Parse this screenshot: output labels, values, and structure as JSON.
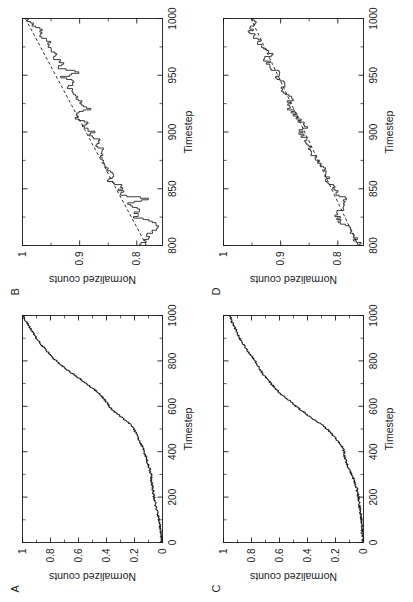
{
  "figure": {
    "layout": "2x2 panel grid, rotated 90 degrees counter-clockwise on the page",
    "background_color": "#ffffff",
    "line_color": "#1a1a1a",
    "panels": [
      "A",
      "B",
      "C",
      "D"
    ]
  },
  "panels": {
    "A": {
      "label": "A"
    },
    "B": {
      "label": "B"
    },
    "C": {
      "label": "C"
    },
    "D": {
      "label": "D"
    }
  },
  "chart_data": [
    {
      "panel": "A",
      "type": "line",
      "title": "",
      "xlabel": "Timestep",
      "ylabel": "Normalized counts",
      "xlim": [
        0,
        1000
      ],
      "ylim": [
        0,
        1
      ],
      "xticks": [
        "0",
        "200",
        "400",
        "600",
        "800",
        "1000"
      ],
      "xtick_values": [
        0,
        200,
        400,
        600,
        800,
        1000
      ],
      "yticks": [
        "0",
        "0.2",
        "0.4",
        "0.6",
        "0.8",
        "1"
      ],
      "ytick_values": [
        0,
        0.2,
        0.4,
        0.6,
        0.8,
        1
      ],
      "grid": false,
      "legend": "none",
      "series": [
        {
          "name": "normalized counts",
          "style": "solid",
          "x": [
            0,
            20,
            40,
            60,
            80,
            100,
            120,
            140,
            160,
            180,
            200,
            220,
            240,
            260,
            280,
            300,
            320,
            340,
            360,
            380,
            400,
            420,
            440,
            460,
            480,
            500,
            520,
            540,
            560,
            580,
            600,
            620,
            640,
            660,
            680,
            700,
            720,
            740,
            760,
            780,
            800,
            820,
            840,
            860,
            880,
            900,
            920,
            940,
            960,
            980,
            1000
          ],
          "values": [
            0.005,
            0.008,
            0.012,
            0.015,
            0.02,
            0.025,
            0.032,
            0.04,
            0.048,
            0.055,
            0.06,
            0.065,
            0.07,
            0.075,
            0.08,
            0.082,
            0.09,
            0.1,
            0.11,
            0.12,
            0.13,
            0.145,
            0.16,
            0.175,
            0.19,
            0.205,
            0.23,
            0.27,
            0.31,
            0.35,
            0.38,
            0.4,
            0.43,
            0.46,
            0.5,
            0.545,
            0.59,
            0.635,
            0.68,
            0.72,
            0.76,
            0.79,
            0.82,
            0.85,
            0.875,
            0.9,
            0.92,
            0.94,
            0.96,
            0.98,
            0.995
          ]
        }
      ]
    },
    {
      "panel": "B",
      "type": "line",
      "title": "",
      "xlabel": "Timestep",
      "ylabel": "Normalized counts",
      "xlim": [
        800,
        1000
      ],
      "ylim": [
        0.755,
        1.0
      ],
      "xticks": [
        "800",
        "850",
        "900",
        "950",
        "1000"
      ],
      "xtick_values": [
        800,
        850,
        900,
        950,
        1000
      ],
      "yticks": [
        "0.8",
        "0.9",
        "1"
      ],
      "ytick_values": [
        0.8,
        0.9,
        1
      ],
      "grid": false,
      "legend": "none",
      "series": [
        {
          "name": "normalized counts",
          "style": "solid-step",
          "x": [
            800,
            804,
            808,
            812,
            816,
            820,
            824,
            828,
            832,
            836,
            840,
            844,
            848,
            852,
            856,
            860,
            864,
            868,
            872,
            876,
            880,
            884,
            888,
            892,
            896,
            900,
            904,
            908,
            912,
            916,
            920,
            924,
            928,
            932,
            936,
            940,
            944,
            948,
            952,
            956,
            960,
            964,
            968,
            972,
            976,
            980,
            984,
            988,
            992,
            996,
            1000
          ],
          "values": [
            0.793,
            0.784,
            0.782,
            0.772,
            0.765,
            0.768,
            0.802,
            0.803,
            0.795,
            0.818,
            0.778,
            0.826,
            0.828,
            0.824,
            0.848,
            0.842,
            0.846,
            0.855,
            0.852,
            0.864,
            0.858,
            0.862,
            0.872,
            0.866,
            0.88,
            0.878,
            0.894,
            0.886,
            0.906,
            0.902,
            0.882,
            0.898,
            0.904,
            0.912,
            0.918,
            0.916,
            0.908,
            0.93,
            0.902,
            0.936,
            0.93,
            0.942,
            0.945,
            0.952,
            0.948,
            0.958,
            0.972,
            0.966,
            0.978,
            0.985,
            0.995
          ]
        },
        {
          "name": "linear fit",
          "style": "dashed",
          "x": [
            800,
            1000
          ],
          "values": [
            0.783,
            0.995
          ]
        }
      ]
    },
    {
      "panel": "C",
      "type": "line",
      "title": "",
      "xlabel": "Timestep",
      "ylabel": "Normalized counts",
      "xlim": [
        0,
        1000
      ],
      "ylim": [
        0,
        1
      ],
      "xticks": [
        "0",
        "200",
        "400",
        "600",
        "800",
        "1000"
      ],
      "xtick_values": [
        0,
        200,
        400,
        600,
        800,
        1000
      ],
      "yticks": [
        "0",
        "0.2",
        "0.4",
        "0.6",
        "0.8",
        "1"
      ],
      "ytick_values": [
        0,
        0.2,
        0.4,
        0.6,
        0.8,
        1
      ],
      "grid": false,
      "legend": "none",
      "series": [
        {
          "name": "normalized counts",
          "style": "solid",
          "x": [
            0,
            20,
            40,
            60,
            80,
            100,
            120,
            140,
            160,
            180,
            200,
            220,
            240,
            260,
            280,
            300,
            320,
            340,
            360,
            380,
            400,
            420,
            440,
            460,
            480,
            500,
            520,
            540,
            560,
            580,
            600,
            620,
            640,
            660,
            680,
            700,
            720,
            740,
            760,
            780,
            800,
            820,
            840,
            860,
            880,
            900,
            920,
            940,
            960,
            980,
            1000
          ],
          "values": [
            0.004,
            0.006,
            0.008,
            0.01,
            0.013,
            0.016,
            0.02,
            0.024,
            0.028,
            0.032,
            0.036,
            0.042,
            0.05,
            0.06,
            0.072,
            0.085,
            0.1,
            0.115,
            0.125,
            0.135,
            0.14,
            0.15,
            0.175,
            0.2,
            0.23,
            0.26,
            0.3,
            0.35,
            0.4,
            0.44,
            0.48,
            0.52,
            0.56,
            0.6,
            0.63,
            0.66,
            0.69,
            0.715,
            0.735,
            0.755,
            0.775,
            0.8,
            0.82,
            0.845,
            0.865,
            0.885,
            0.9,
            0.915,
            0.93,
            0.945,
            0.955
          ]
        }
      ]
    },
    {
      "panel": "D",
      "type": "line",
      "title": "",
      "xlabel": "Timestep",
      "ylabel": "Normalized counts",
      "xlim": [
        800,
        1000
      ],
      "ylim": [
        0.755,
        1.0
      ],
      "xticks": [
        "800",
        "850",
        "900",
        "950",
        "1000"
      ],
      "xtick_values": [
        800,
        850,
        900,
        950,
        1000
      ],
      "yticks": [
        "0.8",
        "0.9",
        "1"
      ],
      "ytick_values": [
        0.8,
        0.9,
        1
      ],
      "grid": false,
      "legend": "none",
      "series": [
        {
          "name": "normalized counts",
          "style": "solid-step",
          "x": [
            800,
            804,
            808,
            812,
            816,
            820,
            824,
            828,
            832,
            836,
            840,
            844,
            848,
            852,
            856,
            860,
            864,
            868,
            872,
            876,
            880,
            884,
            888,
            892,
            896,
            900,
            904,
            908,
            912,
            916,
            920,
            924,
            928,
            932,
            936,
            940,
            944,
            948,
            952,
            956,
            960,
            964,
            968,
            972,
            976,
            980,
            984,
            988,
            992,
            996,
            1000
          ],
          "values": [
            0.762,
            0.768,
            0.772,
            0.776,
            0.78,
            0.795,
            0.8,
            0.802,
            0.79,
            0.788,
            0.786,
            0.8,
            0.804,
            0.812,
            0.82,
            0.818,
            0.826,
            0.824,
            0.83,
            0.84,
            0.844,
            0.846,
            0.852,
            0.856,
            0.862,
            0.866,
            0.856,
            0.864,
            0.872,
            0.876,
            0.884,
            0.888,
            0.88,
            0.886,
            0.896,
            0.892,
            0.9,
            0.906,
            0.904,
            0.916,
            0.922,
            0.926,
            0.918,
            0.93,
            0.936,
            0.94,
            0.944,
            0.952,
            0.948,
            0.946,
            0.95
          ]
        },
        {
          "name": "linear fit",
          "style": "dashed",
          "x": [
            800,
            1000
          ],
          "values": [
            0.764,
            0.952
          ]
        }
      ]
    }
  ]
}
